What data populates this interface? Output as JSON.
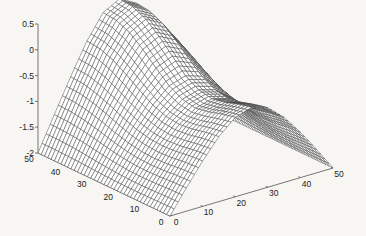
{
  "chart_data": {
    "type": "surface-mesh",
    "title": "",
    "xlabel": "",
    "ylabel": "",
    "zlabel": "",
    "x_range": [
      0,
      50
    ],
    "y_range": [
      0,
      50
    ],
    "z_range": [
      -2,
      0.5
    ],
    "x_ticks": [
      "0",
      "10",
      "20",
      "30",
      "40",
      "50"
    ],
    "y_ticks": [
      "0",
      "10",
      "20",
      "30",
      "40",
      "50"
    ],
    "z_ticks": [
      "-2",
      "-1.5",
      "-1",
      "-0.5",
      "0",
      "0.5"
    ],
    "grid_x": [
      0,
      5,
      10,
      15,
      20,
      25,
      30,
      35,
      40,
      45,
      50
    ],
    "grid_y": [
      0,
      5,
      10,
      15,
      20,
      25,
      30,
      35,
      40,
      45,
      50
    ],
    "z_values_note": "rows indexed by y (0..50), columns by x (0..50)",
    "z_values": [
      [
        -2.0,
        -1.55,
        -1.12,
        -0.74,
        -0.46,
        -0.36,
        -0.46,
        -0.74,
        -1.12,
        -1.55,
        -2.0
      ],
      [
        -2.0,
        -1.56,
        -1.14,
        -0.78,
        -0.52,
        -0.42,
        -0.52,
        -0.78,
        -1.14,
        -1.56,
        -2.0
      ],
      [
        -2.0,
        -1.58,
        -1.18,
        -0.84,
        -0.6,
        -0.51,
        -0.6,
        -0.84,
        -1.18,
        -1.58,
        -2.0
      ],
      [
        -2.0,
        -1.59,
        -1.2,
        -0.87,
        -0.65,
        -0.56,
        -0.65,
        -0.87,
        -1.2,
        -1.59,
        -2.0
      ],
      [
        -2.0,
        -1.58,
        -1.18,
        -0.84,
        -0.6,
        -0.51,
        -0.6,
        -0.84,
        -1.18,
        -1.58,
        -2.0
      ],
      [
        -2.0,
        -1.55,
        -1.12,
        -0.74,
        -0.46,
        -0.36,
        -0.46,
        -0.74,
        -1.12,
        -1.55,
        -2.0
      ],
      [
        -2.0,
        -1.5,
        -1.02,
        -0.58,
        -0.24,
        -0.1,
        -0.24,
        -0.58,
        -1.02,
        -1.5,
        -2.0
      ],
      [
        -2.0,
        -1.44,
        -0.9,
        -0.4,
        0.0,
        0.16,
        0.0,
        -0.4,
        -0.9,
        -1.44,
        -2.0
      ],
      [
        -2.0,
        -1.39,
        -0.8,
        -0.24,
        0.2,
        0.37,
        0.2,
        -0.24,
        -0.8,
        -1.39,
        -2.0
      ],
      [
        -2.0,
        -1.36,
        -0.73,
        -0.14,
        0.32,
        0.49,
        0.32,
        -0.14,
        -0.73,
        -1.36,
        -2.0
      ],
      [
        -2.0,
        -1.35,
        -0.71,
        -0.11,
        0.35,
        0.52,
        0.35,
        -0.11,
        -0.71,
        -1.35,
        -2.0
      ]
    ],
    "mesh_color": "#3a3a3a",
    "face_color": "#ffffff",
    "axis_color": "#555555",
    "grid": false,
    "legend": "none"
  }
}
